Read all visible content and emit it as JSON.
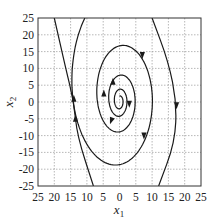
{
  "chart_data": {
    "type": "line",
    "subtype": "phase-portrait",
    "title": "",
    "xlabel": "x1",
    "ylabel": "x2",
    "xlim": [
      -25,
      25
    ],
    "ylim": [
      -25,
      25
    ],
    "grid": true,
    "x_ticks": [
      -25,
      -20,
      -15,
      -10,
      -5,
      0,
      5,
      10,
      15,
      20,
      25
    ],
    "x_tick_labels": [
      "25",
      "20",
      "15",
      "10",
      "5",
      "0",
      "5",
      "10",
      "15",
      "20",
      "25"
    ],
    "y_ticks": [
      25,
      20,
      15,
      10,
      5,
      0,
      -5,
      -10,
      -15,
      -20,
      -25
    ],
    "y_tick_labels": [
      "25",
      "20",
      "15",
      "10",
      "5",
      "0",
      "-5",
      "-10",
      "-15",
      "-20",
      "-25"
    ],
    "legend": null,
    "series": [
      {
        "name": "trajectory",
        "description": "Unstable focus: clockwise outward spiral from origin",
        "direction": "clockwise",
        "spiral": {
          "x_amp0": 0.9,
          "y_amp0": 1.6,
          "growth_per_rad": 0.118,
          "y_offset_ratio": 0.13,
          "theta_max": 40
        },
        "approx_crossings_x2_zero_right": [
          1.5,
          3,
          5.5,
          8,
          12,
          17.5
        ],
        "approx_crossings_x2_zero_left": [
          -1,
          -3,
          -5,
          -7.5,
          -14
        ],
        "outer_branches": [
          {
            "side": "left",
            "points": [
              [
                -20,
                25
              ],
              [
                -16.5,
                10
              ],
              [
                -14,
                0
              ],
              [
                -13,
                -10
              ],
              [
                -8,
                -25
              ]
            ]
          },
          {
            "side": "right",
            "points": [
              [
                10,
                25
              ],
              [
                15,
                12
              ],
              [
                17.5,
                0
              ],
              [
                17,
                -12
              ],
              [
                12,
                -25
              ]
            ]
          }
        ]
      }
    ],
    "arrows": [
      {
        "x": -14,
        "y": 1,
        "dir": "up"
      },
      {
        "x": -4.8,
        "y": 2.5,
        "dir": "up"
      },
      {
        "x": -2,
        "y": 6,
        "dir": "up"
      },
      {
        "x": 7,
        "y": 14,
        "dir": "down"
      },
      {
        "x": 3,
        "y": -0.5,
        "dir": "down"
      },
      {
        "x": 17.5,
        "y": -1,
        "dir": "down"
      },
      {
        "x": -2.5,
        "y": -5.5,
        "dir": "down-left"
      },
      {
        "x": 7.5,
        "y": -10,
        "dir": "down"
      },
      {
        "x": -13.5,
        "y": -5,
        "dir": "up"
      }
    ]
  }
}
